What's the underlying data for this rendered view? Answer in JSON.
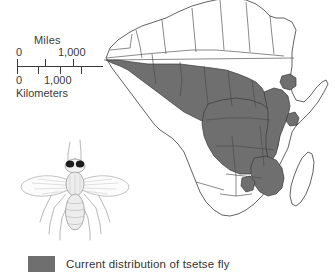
{
  "figure": {
    "colors": {
      "distribution_fill": "#6f6f6f",
      "land_fill": "#ffffff",
      "border_stroke": "#3a3a3a",
      "text": "#333333"
    }
  },
  "scale_bar": {
    "miles_label": "Miles",
    "miles_min": "0",
    "miles_max": "1,000",
    "kilometers_label": "Kilometers",
    "kilometers_min": "0",
    "kilometers_max": "1,000"
  },
  "illustration": {
    "name": "tsetse-fly",
    "caption": ""
  },
  "legend": {
    "items": [
      {
        "swatch_color": "#6f6f6f",
        "label": "Current distribution of tsetse fly"
      }
    ]
  },
  "map": {
    "region": "Africa",
    "shaded_meaning": "Current distribution of tsetse fly",
    "unshaded_meaning": "No current tsetse fly distribution",
    "shaded_areas": [
      "West Africa",
      "Sahel southern margin",
      "Central Africa / Congo basin",
      "East Africa interior",
      "Southeastern Africa"
    ],
    "unshaded_areas": [
      "North Africa",
      "Sahara",
      "Horn of Africa",
      "Southern Africa",
      "Madagascar"
    ]
  }
}
